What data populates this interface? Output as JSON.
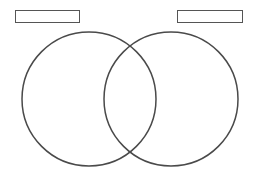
{
  "diagram": {
    "type": "venn",
    "stroke_color": "#4a4a4a",
    "background": "#ffffff",
    "labels": [
      {
        "id": "left",
        "text": ""
      },
      {
        "id": "right",
        "text": ""
      }
    ],
    "circles": [
      {
        "id": "left",
        "cx": 89,
        "cy": 99,
        "r": 67
      },
      {
        "id": "right",
        "cx": 171,
        "cy": 99,
        "r": 67
      }
    ]
  }
}
